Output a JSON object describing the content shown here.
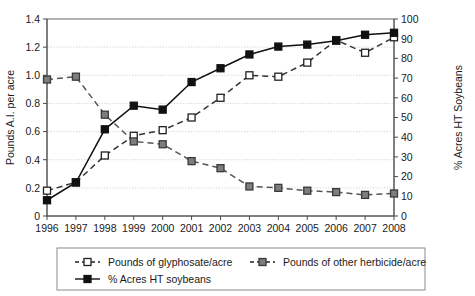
{
  "chart_data": {
    "type": "line",
    "title": "",
    "xlabel": "",
    "ylabel": "Pounds A.I. per acre",
    "y2label": "% Acres HT Soybeans",
    "grid": true,
    "legend_position": "bottom",
    "ylim": [
      0,
      1.4
    ],
    "y2lim": [
      0,
      100
    ],
    "yticks": [
      "0",
      "0.2",
      "0.4",
      "0.6",
      "0.8",
      "1.0",
      "1.2",
      "1.4"
    ],
    "ytick_values": [
      0,
      0.2,
      0.4,
      0.6,
      0.8,
      1.0,
      1.2,
      1.4
    ],
    "y2ticks": [
      "0",
      "10",
      "20",
      "30",
      "40",
      "50",
      "60",
      "70",
      "80",
      "90",
      "100"
    ],
    "y2tick_values": [
      0,
      10,
      20,
      30,
      40,
      50,
      60,
      70,
      80,
      90,
      100
    ],
    "categories": [
      "1996",
      "1997",
      "1998",
      "1999",
      "2000",
      "2001",
      "2002",
      "2003",
      "2004",
      "2005",
      "2006",
      "2007",
      "2008"
    ],
    "x": [
      1996,
      1997,
      1998,
      1999,
      2000,
      2001,
      2002,
      2003,
      2004,
      2005,
      2006,
      2007,
      2008
    ],
    "series": [
      {
        "name": "Pounds of glyphosate/acre",
        "axis": "left",
        "marker": "open-square",
        "linestyle": "dashed",
        "color": "#333333",
        "marker_fill": "#ffffff",
        "values": [
          0.18,
          0.24,
          0.43,
          0.57,
          0.61,
          0.7,
          0.84,
          1.0,
          0.99,
          1.09,
          1.25,
          1.16,
          1.27
        ]
      },
      {
        "name": "Pounds of other herbicide/acre",
        "axis": "left",
        "marker": "filled-square",
        "linestyle": "dashed",
        "color": "#555555",
        "marker_fill": "#7a7a7a",
        "values": [
          0.97,
          0.99,
          0.72,
          0.53,
          0.51,
          0.39,
          0.34,
          0.21,
          0.2,
          0.18,
          0.17,
          0.15,
          0.16
        ]
      },
      {
        "name": "% Acres HT soybeans",
        "axis": "right",
        "marker": "filled-square",
        "linestyle": "solid",
        "color": "#111111",
        "marker_fill": "#111111",
        "values": [
          8,
          17,
          44,
          56,
          54,
          68,
          75,
          82,
          86,
          87,
          89,
          92,
          93
        ]
      }
    ],
    "legend": [
      {
        "label": "Pounds of glyphosate/acre",
        "marker": "open-square",
        "linestyle": "dashed"
      },
      {
        "label": "Pounds of other herbicide/acre",
        "marker": "gray-square",
        "linestyle": "dashed"
      },
      {
        "label": "% Acres HT soybeans",
        "marker": "filled-square",
        "linestyle": "solid"
      }
    ]
  }
}
